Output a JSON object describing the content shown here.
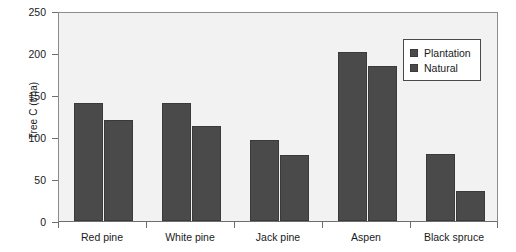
{
  "chart_data": {
    "type": "bar",
    "title": "",
    "xlabel": "",
    "ylabel": "Tree C (t/ha)",
    "ylim": [
      0,
      250
    ],
    "yticks": [
      0,
      50,
      100,
      150,
      200,
      250
    ],
    "ytick_labels": [
      "0",
      "50",
      "100",
      "150",
      "200",
      "250"
    ],
    "grid": false,
    "legend_position": "top-right",
    "categories": [
      "Red pine",
      "White pine",
      "Jack pine",
      "Aspen",
      "Black spruce"
    ],
    "series": [
      {
        "name": "Plantation",
        "color": "#4a4a4a",
        "values": [
          140,
          140,
          97,
          201,
          80
        ]
      },
      {
        "name": "Natural",
        "color": "#4a4a4a",
        "values": [
          120,
          113,
          79,
          184,
          36
        ]
      }
    ]
  },
  "legend": {
    "items": [
      {
        "label": "Plantation",
        "swatch_icon": "square-swatch-icon"
      },
      {
        "label": "Natural",
        "swatch_icon": "square-swatch-icon"
      }
    ]
  },
  "axes": {
    "y_title": "Tree C (t/ha)",
    "y_tick_labels": [
      "250",
      "200",
      "150",
      "100",
      "50",
      "0"
    ],
    "x_tick_labels": [
      "Red pine",
      "White pine",
      "Jack pine",
      "Aspen",
      "Black spruce"
    ]
  }
}
